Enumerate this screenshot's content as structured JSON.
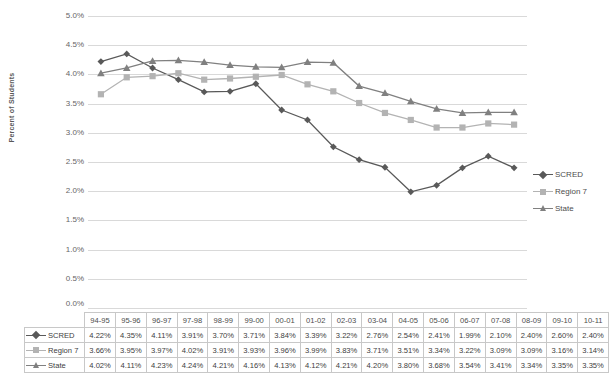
{
  "chart_data": {
    "type": "line",
    "title": "",
    "xlabel": "",
    "ylabel": "Percent of Students",
    "ylim": [
      0.0,
      5.0
    ],
    "ytick_labels": [
      "5.0%",
      "4.5%",
      "4.0%",
      "3.5%",
      "3.0%",
      "2.5%",
      "2.0%",
      "1.5%",
      "1.0%",
      "0.5%",
      "0.0%"
    ],
    "ytick_values": [
      5.0,
      4.5,
      4.0,
      3.5,
      3.0,
      2.5,
      2.0,
      1.5,
      1.0,
      0.5,
      0.0
    ],
    "grid": true,
    "legend_position": "right",
    "categories": [
      "94-95",
      "95-96",
      "96-97",
      "97-98",
      "98-99",
      "99-00",
      "00-01",
      "01-02",
      "02-03",
      "03-04",
      "04-05",
      "05-06",
      "06-07",
      "07-08",
      "08-09",
      "09-10",
      "10-11"
    ],
    "series": [
      {
        "name": "SCRED",
        "color": "#595959",
        "marker": "diamond",
        "values": [
          4.22,
          4.35,
          4.11,
          3.91,
          3.7,
          3.71,
          3.84,
          3.39,
          3.22,
          2.76,
          2.54,
          2.41,
          1.99,
          2.1,
          2.4,
          2.6,
          2.4
        ],
        "labels": [
          "4.22%",
          "4.35%",
          "4.11%",
          "3.91%",
          "3.70%",
          "3.71%",
          "3.84%",
          "3.39%",
          "3.22%",
          "2.76%",
          "2.54%",
          "2.41%",
          "1.99%",
          "2.10%",
          "2.40%",
          "2.60%",
          "2.40%"
        ]
      },
      {
        "name": "Region 7",
        "color": "#b3b3b3",
        "marker": "square",
        "values": [
          3.66,
          3.95,
          3.97,
          4.02,
          3.91,
          3.93,
          3.96,
          3.99,
          3.83,
          3.71,
          3.51,
          3.34,
          3.22,
          3.09,
          3.09,
          3.16,
          3.14
        ],
        "labels": [
          "3.66%",
          "3.95%",
          "3.97%",
          "4.02%",
          "3.91%",
          "3.93%",
          "3.96%",
          "3.99%",
          "3.83%",
          "3.71%",
          "3.51%",
          "3.34%",
          "3.22%",
          "3.09%",
          "3.09%",
          "3.16%",
          "3.14%"
        ]
      },
      {
        "name": "State",
        "color": "#808080",
        "marker": "triangle",
        "values": [
          4.02,
          4.11,
          4.23,
          4.24,
          4.21,
          4.16,
          4.13,
          4.12,
          4.21,
          4.2,
          3.8,
          3.68,
          3.54,
          3.41,
          3.34,
          3.35,
          3.35
        ],
        "labels": [
          "4.02%",
          "4.11%",
          "4.23%",
          "4.24%",
          "4.21%",
          "4.16%",
          "4.13%",
          "4.12%",
          "4.21%",
          "4.20%",
          "3.80%",
          "3.68%",
          "3.54%",
          "3.41%",
          "3.34%",
          "3.35%",
          "3.35%"
        ]
      }
    ]
  },
  "legend": {
    "items": [
      {
        "label": "SCRED"
      },
      {
        "label": "Region 7"
      },
      {
        "label": "State"
      }
    ]
  },
  "table": {
    "corner_label": "",
    "zero_label": "0.0%"
  }
}
